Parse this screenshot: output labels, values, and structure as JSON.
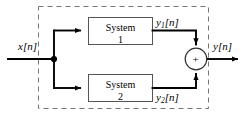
{
  "diagram": {
    "type": "block-diagram",
    "colors": {
      "line": "#000000",
      "block_border": "#555555",
      "dashed_border": "#777777",
      "background": "#ffffff",
      "text": "#000000"
    },
    "input": {
      "label_base": "x",
      "label_index": "[n]",
      "name": "input-signal-label"
    },
    "output": {
      "label_base": "y",
      "label_index": "[n]",
      "name": "output-signal-label"
    },
    "blocks": [
      {
        "id": "system-1",
        "line1": "System",
        "line2": "1",
        "output_base": "y",
        "output_sub": "1",
        "output_index": "[n]"
      },
      {
        "id": "system-2",
        "line1": "System",
        "line2": "2",
        "output_base": "y",
        "output_sub": "2",
        "output_index": "[n]"
      }
    ],
    "adder": {
      "symbol": "+",
      "name": "summing-junction"
    },
    "junction": {
      "name": "branch-node"
    },
    "enclosure": {
      "name": "dashed-system-boundary",
      "style": "dashed"
    }
  }
}
